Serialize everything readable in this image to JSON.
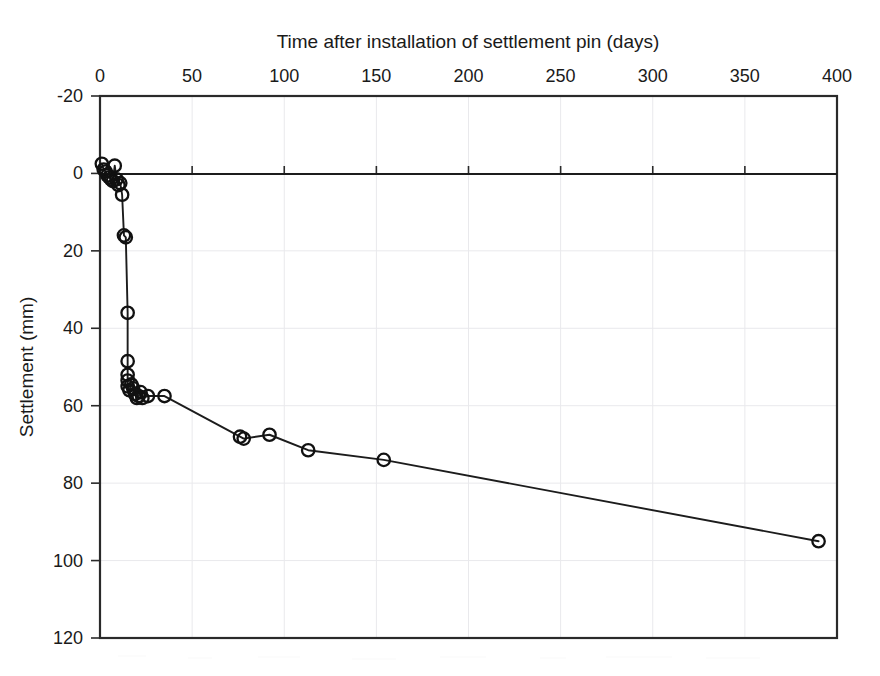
{
  "chart_data": {
    "type": "line",
    "title": "Time after installation of settlement pin (days)",
    "xlabel": "Time after installation of settlement pin (days)",
    "ylabel": "Settlement (mm)",
    "xlim": [
      0,
      400
    ],
    "ylim": [
      -20,
      120
    ],
    "y_inverted": true,
    "x_axis_position": "top",
    "grid": true,
    "legend": "none",
    "marker": "open-circle",
    "line_color": "#1c1c1c",
    "marker_color": "#111111",
    "xticks": [
      0,
      50,
      100,
      150,
      200,
      250,
      300,
      350,
      400
    ],
    "xtick_labels": [
      "0",
      "50",
      "100",
      "150",
      "200",
      "250",
      "300",
      "350",
      "400"
    ],
    "yticks": [
      -20,
      0,
      20,
      40,
      60,
      80,
      100,
      120
    ],
    "ytick_labels": [
      "-20",
      "0",
      "20",
      "40",
      "60",
      "80",
      "100",
      "120"
    ],
    "series": [
      {
        "name": "Settlement",
        "x": [
          1,
          2,
          3,
          4,
          5,
          6,
          7,
          8,
          9,
          10,
          11,
          12,
          13,
          14,
          15,
          15,
          15,
          15,
          15,
          16,
          17,
          18,
          19,
          20,
          21,
          22,
          23,
          26,
          35,
          76,
          78,
          92,
          113,
          154,
          390
        ],
        "y": [
          -2.5,
          -1.0,
          -0.5,
          0.5,
          1.0,
          1.5,
          2.0,
          -2.0,
          1.5,
          3.0,
          2.5,
          5.5,
          16.0,
          16.5,
          36.0,
          48.5,
          52.0,
          53.5,
          55.0,
          56.0,
          54.5,
          55.5,
          57.0,
          58.0,
          57.5,
          56.5,
          58.0,
          57.5,
          57.5,
          68.0,
          68.5,
          67.5,
          71.5,
          74.0,
          95.0
        ]
      }
    ]
  }
}
